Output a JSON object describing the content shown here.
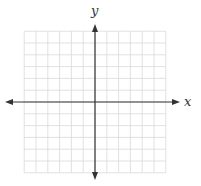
{
  "diagram": {
    "type": "coordinate-plane",
    "x_axis_label": "x",
    "y_axis_label": "y",
    "grid": {
      "cells_per_side": 6,
      "origin_px": [
        95,
        102
      ],
      "cell_size_px": 11.8,
      "grid_color": "#d9d9d9",
      "axis_color": "#333333"
    }
  }
}
